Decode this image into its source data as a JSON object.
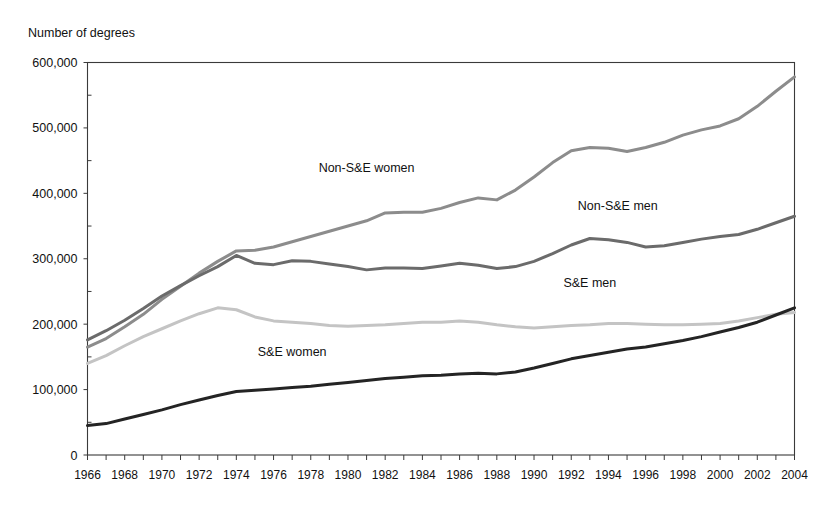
{
  "chart_data": {
    "type": "line",
    "title": "",
    "ylabel": "Number of degrees",
    "xlabel": "",
    "ylim": [
      0,
      600000
    ],
    "ytick_values": [
      0,
      100000,
      200000,
      300000,
      400000,
      500000,
      600000
    ],
    "ytick_labels": [
      "0",
      "100,000",
      "200,000",
      "300,000",
      "400,000",
      "500,000",
      "600,000"
    ],
    "xlim": [
      1966,
      2004
    ],
    "x": [
      1966,
      1967,
      1968,
      1969,
      1970,
      1971,
      1972,
      1973,
      1974,
      1975,
      1976,
      1977,
      1978,
      1979,
      1980,
      1981,
      1982,
      1983,
      1984,
      1985,
      1986,
      1987,
      1988,
      1989,
      1990,
      1991,
      1992,
      1993,
      1994,
      1995,
      1996,
      1997,
      1998,
      1999,
      2000,
      2001,
      2002,
      2003,
      2004
    ],
    "xtick_labels": [
      "1966",
      "1968",
      "1970",
      "1972",
      "1974",
      "1976",
      "1978",
      "1980",
      "1982",
      "1984",
      "1986",
      "1988",
      "1990",
      "1992",
      "1994",
      "1996",
      "1998",
      "2000",
      "2002",
      "2004"
    ],
    "xtick_values": [
      1966,
      1968,
      1970,
      1972,
      1974,
      1976,
      1978,
      1980,
      1982,
      1984,
      1986,
      1988,
      1990,
      1992,
      1994,
      1996,
      1998,
      2000,
      2002,
      2004
    ],
    "grid": "horizontal-dotted",
    "legend_position": "inline-annotations",
    "series": [
      {
        "name": "Non-S&E women",
        "color": "#8c8c8c",
        "width": 3.0,
        "label_x": 1981.0,
        "label_y": 432000,
        "values": [
          165000,
          178000,
          196000,
          215000,
          238000,
          258000,
          278000,
          296000,
          312000,
          313000,
          318000,
          326000,
          334000,
          342000,
          350000,
          358000,
          370000,
          371000,
          371000,
          377000,
          386000,
          393000,
          390000,
          405000,
          425000,
          447000,
          465000,
          470000,
          469000,
          464000,
          470000,
          478000,
          489000,
          497000,
          503000,
          514000,
          533000,
          556000,
          578000
        ]
      },
      {
        "name": "Non-S&E men",
        "color": "#6b6b6b",
        "width": 3.0,
        "label_x": 1994.5,
        "label_y": 374000,
        "values": [
          176000,
          190000,
          206000,
          224000,
          243000,
          259000,
          274000,
          288000,
          305000,
          293000,
          291000,
          297000,
          296000,
          292000,
          288000,
          283000,
          286000,
          286000,
          285000,
          289000,
          293000,
          290000,
          285000,
          288000,
          296000,
          308000,
          321000,
          331000,
          329000,
          325000,
          318000,
          320000,
          325000,
          330000,
          334000,
          337000,
          345000,
          355000,
          365000
        ]
      },
      {
        "name": "S&E men",
        "color": "#c4c4c4",
        "width": 3.0,
        "label_x": 1993.0,
        "label_y": 257000,
        "values": [
          140000,
          152000,
          167000,
          181000,
          193000,
          205000,
          216000,
          225000,
          222000,
          211000,
          205000,
          203000,
          201000,
          198000,
          197000,
          198000,
          199000,
          201000,
          203000,
          203000,
          205000,
          203000,
          199000,
          196000,
          194000,
          196000,
          198000,
          199000,
          201000,
          201000,
          200000,
          199000,
          199000,
          200000,
          201000,
          205000,
          210000,
          215000,
          218000
        ]
      },
      {
        "name": "S&E women",
        "color": "#242424",
        "width": 3.0,
        "label_x": 1977.0,
        "label_y": 152000,
        "values": [
          45000,
          48000,
          55000,
          62000,
          69000,
          77000,
          84000,
          91000,
          97000,
          99000,
          101000,
          103000,
          105000,
          108000,
          111000,
          114000,
          117000,
          119000,
          121000,
          122000,
          124000,
          125000,
          124000,
          127000,
          133000,
          140000,
          147000,
          152000,
          157000,
          162000,
          165000,
          170000,
          175000,
          181000,
          188000,
          195000,
          203000,
          214000,
          225000
        ]
      }
    ]
  }
}
